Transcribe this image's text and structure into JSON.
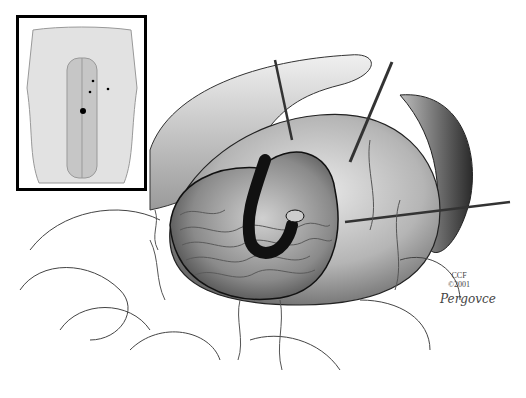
{
  "figure": {
    "type": "medical-illustration",
    "inset": {
      "subject": "Anterior abdomen showing port/incision sites",
      "port_marks": 4
    }
  },
  "credit": {
    "line1": "CCF",
    "line2": "©2001",
    "signature": "Pergovce"
  },
  "colors": {
    "ink": "#000000",
    "background": "#ffffff",
    "tissue": "#9a9a9a"
  }
}
